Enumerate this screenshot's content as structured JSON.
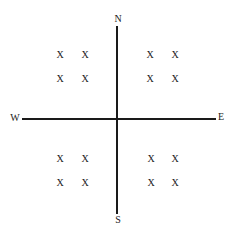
{
  "diagram": {
    "type": "compass-quadrants",
    "directions": {
      "north": "N",
      "south": "S",
      "west": "W",
      "east": "E"
    },
    "quadrants": [
      {
        "name": "northwest",
        "marks": [
          "X",
          "X",
          "X",
          "X"
        ]
      },
      {
        "name": "northeast",
        "marks": [
          "X",
          "X",
          "X",
          "X"
        ]
      },
      {
        "name": "southwest",
        "marks": [
          "X",
          "X",
          "X",
          "X"
        ]
      },
      {
        "name": "southeast",
        "marks": [
          "X",
          "X",
          "X",
          "X"
        ]
      }
    ],
    "colors": {
      "line": "#1a1a1a",
      "text": "#222222",
      "background": "#ffffff"
    }
  }
}
